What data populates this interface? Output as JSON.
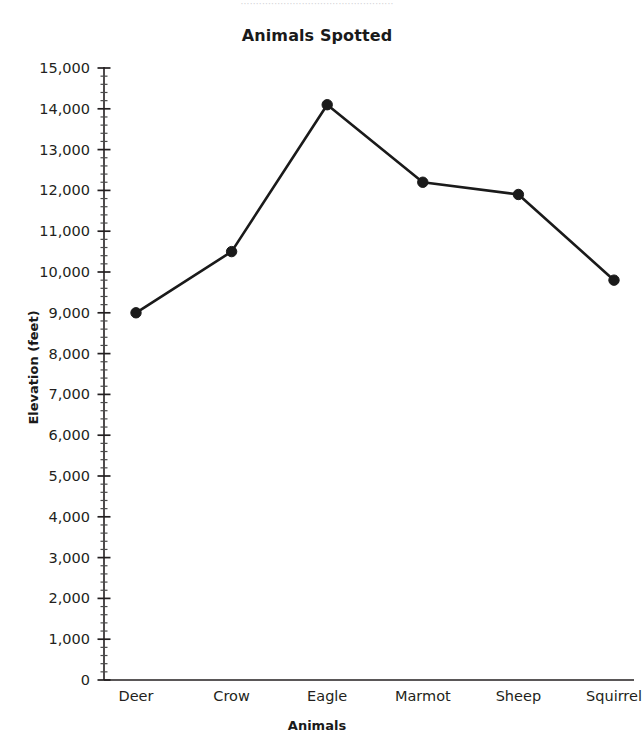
{
  "top_sliver_text": "··················································",
  "chart_data": {
    "type": "line",
    "title": "Animals Spotted",
    "xlabel": "Animals",
    "ylabel": "Elevation (feet)",
    "categories": [
      "Deer",
      "Crow",
      "Eagle",
      "Marmot",
      "Sheep",
      "Squirrel"
    ],
    "values": [
      9000,
      10500,
      14100,
      12200,
      11900,
      9800
    ],
    "ylim": [
      0,
      15000
    ],
    "y_major_step": 1000,
    "y_minor_step": 200,
    "y_tick_labels": [
      "15,000",
      "14,000",
      "13,000",
      "12,000",
      "11,000",
      "10,000",
      "9,000",
      "8,000",
      "7,000",
      "6,000",
      "5,000",
      "4,000",
      "3,000",
      "2,000",
      "1,000",
      "0"
    ],
    "y_tick_values": [
      15000,
      14000,
      13000,
      12000,
      11000,
      10000,
      9000,
      8000,
      7000,
      6000,
      5000,
      4000,
      3000,
      2000,
      1000,
      0
    ],
    "grid": false,
    "legend": "none",
    "marker": "filled-circle",
    "line_color": "#1a1a1a",
    "marker_color": "#1a1a1a",
    "axis_color": "#231f20",
    "background": "#ffffff"
  }
}
